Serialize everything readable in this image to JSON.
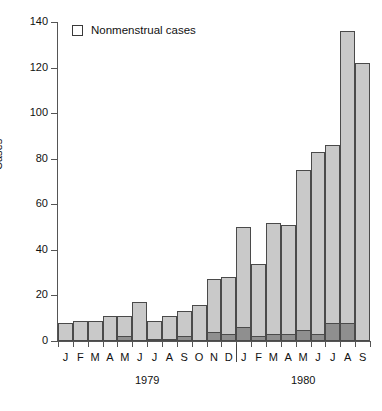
{
  "chart_data": {
    "type": "bar",
    "title": "",
    "subtitle": "",
    "xlabel": "",
    "ylabel": "Cases",
    "ylim": [
      0,
      140
    ],
    "yticks": [
      0,
      20,
      40,
      60,
      80,
      100,
      120,
      140
    ],
    "grid": false,
    "stacked": true,
    "legend_position": "top-left",
    "legend": [
      {
        "label": "Nonmenstrual cases",
        "color": "#ffffff",
        "border": "#3a3a3a"
      }
    ],
    "categories": [
      "J",
      "F",
      "M",
      "A",
      "M",
      "J",
      "J",
      "A",
      "S",
      "O",
      "N",
      "D",
      "J",
      "F",
      "M",
      "A",
      "M",
      "J",
      "J",
      "A",
      "S"
    ],
    "group_labels": [
      "1979",
      "1980"
    ],
    "groups": [
      {
        "label": "1979",
        "start_index": 0,
        "end_index": 11
      },
      {
        "label": "1980",
        "start_index": 12,
        "end_index": 20
      }
    ],
    "series": [
      {
        "name": "Menstrual cases",
        "color": "#8f8f8f",
        "values": [
          0,
          0,
          0,
          0,
          2,
          0,
          1,
          1,
          2,
          0,
          4,
          3,
          6,
          2,
          3,
          3,
          5,
          3,
          8,
          8,
          0
        ]
      },
      {
        "name": "Nonmenstrual cases",
        "color": "#c9c9c9",
        "values": [
          8,
          9,
          9,
          11,
          9,
          17,
          8,
          10,
          11,
          16,
          23,
          25,
          44,
          32,
          49,
          48,
          70,
          80,
          78,
          128,
          122
        ]
      }
    ],
    "totals": [
      8,
      9,
      9,
      11,
      11,
      17,
      9,
      11,
      13,
      16,
      27,
      28,
      50,
      34,
      52,
      51,
      75,
      83,
      86,
      136,
      122
    ]
  }
}
